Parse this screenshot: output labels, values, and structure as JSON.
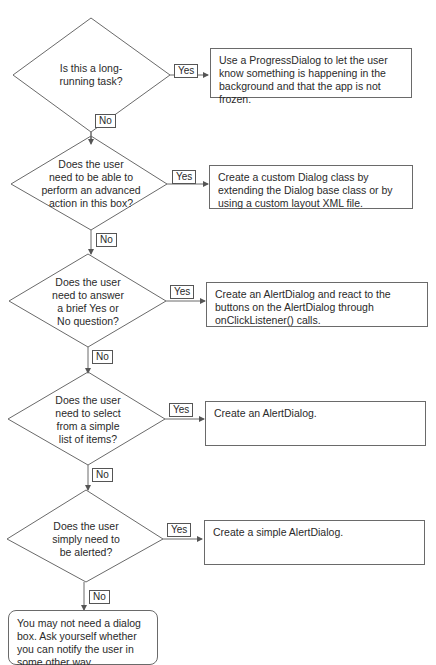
{
  "flowchart": {
    "decisions": [
      {
        "question": "Is this a long-running task?",
        "lines": [
          "Is this a long-",
          "running task?"
        ],
        "yes_label": "Yes",
        "no_label": "No",
        "result": "Use a ProgressDialog to let the user know something is happening in the background and that the app is not frozen."
      },
      {
        "question": "Does the user need to be able to perform an advanced action in this box?",
        "lines": [
          "Does the user",
          "need to be able to",
          "perform an advanced",
          "action in this box?"
        ],
        "yes_label": "Yes",
        "no_label": "No",
        "result": "Create a custom Dialog class by extending the Dialog base class or by using a custom layout XML file."
      },
      {
        "question": "Does the user need to answer a brief Yes or No question?",
        "lines": [
          "Does the user",
          "need to answer",
          "a brief Yes or",
          "No question?"
        ],
        "yes_label": "Yes",
        "no_label": "No",
        "result": "Create an AlertDialog and react to the buttons on the AlertDialog through onClickListener() calls."
      },
      {
        "question": "Does the user need to select from a simple list of items?",
        "lines": [
          "Does the user",
          "need to select",
          "from a simple",
          "list of items?"
        ],
        "yes_label": "Yes",
        "no_label": "No",
        "result": "Create an AlertDialog."
      },
      {
        "question": "Does the user simply need to be alerted?",
        "lines": [
          "Does the user",
          "simply need to",
          "be alerted?"
        ],
        "yes_label": "Yes",
        "no_label": "No",
        "result": "Create a simple AlertDialog."
      }
    ],
    "terminal": "You may not need a dialog box. Ask yourself whether you can notify the user in some other way.",
    "colors": {
      "line": "#6a6a6a",
      "text": "#2a2a2a",
      "background": "#ffffff"
    }
  }
}
